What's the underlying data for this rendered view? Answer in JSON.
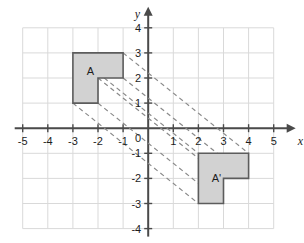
{
  "figure": {
    "type": "coordinate-plane-translation-diagram",
    "background_color": "#ffffff",
    "grid_color": "#d9d9d9",
    "axis_color": "#4a4a4a",
    "shape_fill": "#d2d2d2",
    "shape_stroke": "#5c5c5c",
    "dash_color": "#8a8a8a"
  },
  "axes": {
    "x": {
      "name": "x",
      "min": -5,
      "max": 5,
      "tick_labels": [
        "-5",
        "-4",
        "-3",
        "-2",
        "-1",
        "1",
        "2",
        "3",
        "4",
        "5"
      ],
      "tick_values": [
        -5,
        -4,
        -3,
        -2,
        -1,
        1,
        2,
        3,
        4,
        5
      ],
      "arrow": "right"
    },
    "y": {
      "name": "y",
      "min": -4,
      "max": 4,
      "tick_labels": [
        "4",
        "3",
        "2",
        "1",
        "-1",
        "-2",
        "-3",
        "-4"
      ],
      "tick_values": [
        4,
        3,
        2,
        1,
        -1,
        -2,
        -3,
        -4
      ],
      "arrow": "up"
    },
    "origin_label": "0"
  },
  "grid": {
    "visible": true,
    "x_range": [
      -5,
      5
    ],
    "y_range": [
      -4,
      4
    ],
    "spacing": 1
  },
  "shapes": [
    {
      "id": "shape-a",
      "label": "A",
      "label_position": {
        "x": -2.3,
        "y": 2.12
      },
      "vertices": [
        {
          "x": -3,
          "y": 3
        },
        {
          "x": -1,
          "y": 3
        },
        {
          "x": -1,
          "y": 2
        },
        {
          "x": -2,
          "y": 2
        },
        {
          "x": -2,
          "y": 1
        },
        {
          "x": -3,
          "y": 1
        }
      ]
    },
    {
      "id": "shape-a-prime",
      "label": "A'",
      "label_position": {
        "x": 2.72,
        "y": -2.14
      },
      "vertices": [
        {
          "x": 2,
          "y": -1
        },
        {
          "x": 4,
          "y": -1
        },
        {
          "x": 4,
          "y": -2
        },
        {
          "x": 3,
          "y": -2
        },
        {
          "x": 3,
          "y": -3
        },
        {
          "x": 2,
          "y": -3
        }
      ]
    }
  ],
  "translation": {
    "dx": 5,
    "dy": -4,
    "connector_lines": [
      {
        "from": {
          "x": -3,
          "y": 3
        },
        "to": {
          "x": 2,
          "y": -1
        }
      },
      {
        "from": {
          "x": -1,
          "y": 3
        },
        "to": {
          "x": 4,
          "y": -1
        }
      },
      {
        "from": {
          "x": -1,
          "y": 2
        },
        "to": {
          "x": 4,
          "y": -2
        }
      },
      {
        "from": {
          "x": -2,
          "y": 2
        },
        "to": {
          "x": 3,
          "y": -2
        }
      },
      {
        "from": {
          "x": -2,
          "y": 1
        },
        "to": {
          "x": 3,
          "y": -3
        }
      },
      {
        "from": {
          "x": -3,
          "y": 1
        },
        "to": {
          "x": 2,
          "y": -3
        }
      }
    ]
  }
}
